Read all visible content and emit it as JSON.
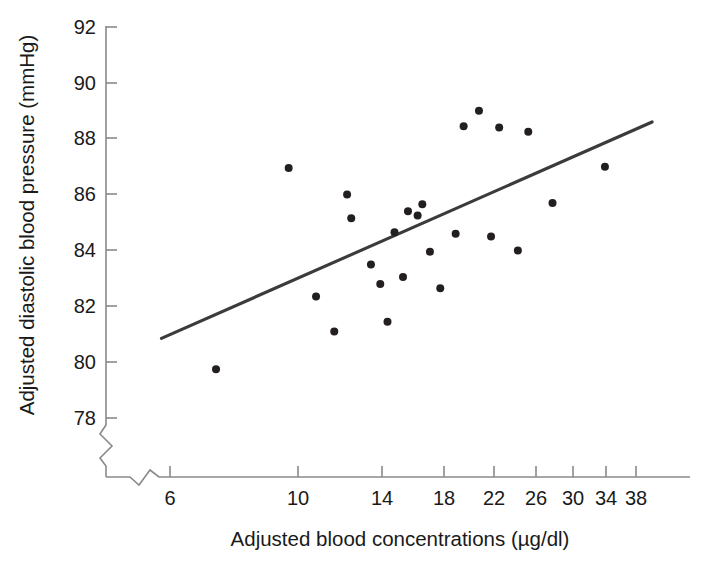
{
  "chart_data": {
    "type": "scatter",
    "title": "",
    "xlabel": "Adjusted blood concentrations (µg/dl)",
    "ylabel": "Adjusted diastolic blood pressure (mmHg)",
    "x_scale": "log",
    "y_scale": "linear",
    "x_ticks": [
      6,
      10,
      14,
      18,
      22,
      26,
      30,
      34,
      38
    ],
    "x_tick_labels": [
      "6",
      "10",
      "14",
      "18",
      "22",
      "26",
      "30",
      "34",
      "38"
    ],
    "y_ticks": [
      78,
      80,
      82,
      84,
      86,
      88,
      90,
      92
    ],
    "y_tick_labels": [
      "78",
      "80",
      "82",
      "84",
      "86",
      "88",
      "90",
      "92"
    ],
    "xlim": [
      5.0,
      42.0
    ],
    "ylim": [
      76.6,
      92.0
    ],
    "grid": false,
    "legend": null,
    "axis_break_x": true,
    "axis_break_y": true,
    "marker": {
      "shape": "circle",
      "color": "#231f20",
      "size": 8
    },
    "points": [
      {
        "x": 7.2,
        "y": 79.75
      },
      {
        "x": 9.6,
        "y": 86.95
      },
      {
        "x": 10.7,
        "y": 82.35
      },
      {
        "x": 11.5,
        "y": 81.1
      },
      {
        "x": 12.1,
        "y": 86.0
      },
      {
        "x": 12.3,
        "y": 85.15
      },
      {
        "x": 13.3,
        "y": 83.5
      },
      {
        "x": 13.8,
        "y": 82.8
      },
      {
        "x": 14.2,
        "y": 81.45
      },
      {
        "x": 14.6,
        "y": 84.65
      },
      {
        "x": 15.1,
        "y": 83.05
      },
      {
        "x": 15.4,
        "y": 85.4
      },
      {
        "x": 16.0,
        "y": 85.25
      },
      {
        "x": 16.3,
        "y": 85.65
      },
      {
        "x": 16.8,
        "y": 83.95
      },
      {
        "x": 17.5,
        "y": 82.65
      },
      {
        "x": 18.6,
        "y": 84.6
      },
      {
        "x": 19.2,
        "y": 88.45
      },
      {
        "x": 20.4,
        "y": 89.0
      },
      {
        "x": 21.4,
        "y": 84.5
      },
      {
        "x": 22.1,
        "y": 88.4
      },
      {
        "x": 23.8,
        "y": 84.0
      },
      {
        "x": 24.8,
        "y": 88.25
      },
      {
        "x": 27.3,
        "y": 85.7
      },
      {
        "x": 33.6,
        "y": 87.0
      }
    ],
    "fit_line": {
      "x_start": 5.8,
      "y_start": 80.85,
      "x_end": 40.5,
      "y_end": 88.6,
      "color": "#3b3a3c"
    }
  },
  "axes": {
    "x_title": "Adjusted blood concentrations (µg/dl)",
    "y_title": "Adjusted diastolic blood pressure (mmHg)"
  }
}
